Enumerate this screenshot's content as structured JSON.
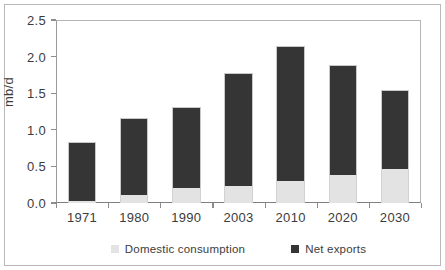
{
  "figure": {
    "clipped_caption": "",
    "background": "#ffffff",
    "frame_color": "#b9b9b9"
  },
  "colors": {
    "domestic": "#e3e3e3",
    "exports": "#353535",
    "axis": "#8d8d8d",
    "text": "#3c3c3c"
  },
  "chart_data": {
    "type": "bar",
    "title": "",
    "xlabel": "",
    "ylabel": "mb/d",
    "ylim": [
      0,
      2.5
    ],
    "yticks": [
      "0.0",
      "0.5",
      "1.0",
      "1.5",
      "2.0",
      "2.5"
    ],
    "ytick_values": [
      0.0,
      0.5,
      1.0,
      1.5,
      2.0,
      2.5
    ],
    "grid": false,
    "stacked": true,
    "legend_position": "bottom",
    "categories": [
      "1971",
      "1980",
      "1990",
      "2003",
      "2010",
      "2020",
      "2030"
    ],
    "series": [
      {
        "name": "Domestic consumption",
        "color": "#e3e3e3",
        "values": [
          0.03,
          0.11,
          0.2,
          0.23,
          0.3,
          0.38,
          0.47
        ]
      },
      {
        "name": "Net exports",
        "color": "#353535",
        "values": [
          0.81,
          1.05,
          1.11,
          1.55,
          1.85,
          1.51,
          1.07
        ]
      }
    ],
    "totals": [
      0.84,
      1.16,
      1.31,
      1.78,
      2.15,
      1.89,
      1.54
    ]
  },
  "legend": {
    "items": [
      {
        "label": "Domestic consumption",
        "swatch": "domestic"
      },
      {
        "label": "Net exports",
        "swatch": "exports"
      }
    ]
  }
}
